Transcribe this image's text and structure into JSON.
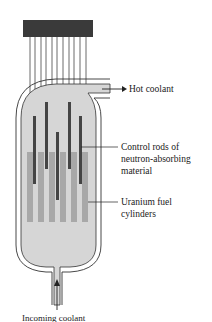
{
  "labels": {
    "hot_coolant": "Hot coolant",
    "control_rods": [
      "Control rods of",
      "neutron-absorbing",
      "material"
    ],
    "fuel": [
      "Uranium fuel",
      "cylinders"
    ],
    "incoming": "Incoming coolant"
  },
  "colors": {
    "housing": "#3a3a3a",
    "coolant": "#d6d6d6",
    "fuel": "#a8a8a8",
    "control_rod": "#444444",
    "outline": "#333333"
  },
  "components": {
    "control_rod_count": 6,
    "fuel_cylinder_count": 6,
    "drive_wire_count": 11
  }
}
